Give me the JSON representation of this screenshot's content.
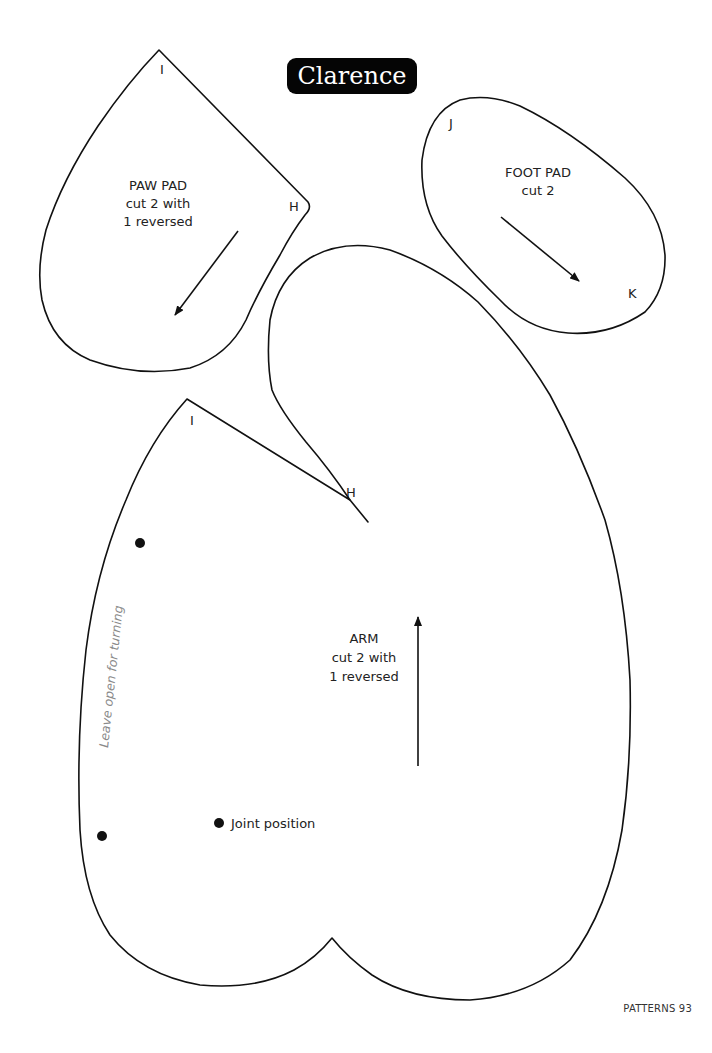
{
  "title": "Clarence",
  "page_footer": "PATTERNS 93",
  "pieces": {
    "paw_pad": {
      "name": "PAW PAD",
      "instruction_line1": "cut 2 with",
      "instruction_line2": "1 reversed",
      "marks": [
        "I",
        "H"
      ]
    },
    "foot_pad": {
      "name": "FOOT PAD",
      "instruction_line1": "cut 2",
      "marks": [
        "J",
        "K"
      ]
    },
    "arm": {
      "name": "ARM",
      "instruction_line1": "cut 2 with",
      "instruction_line2": "1 reversed",
      "marks": [
        "I",
        "H"
      ],
      "opening_note": "Leave open for turning",
      "joint_label": "Joint position"
    }
  },
  "colors": {
    "line": "#111111",
    "title_bg": "#050505",
    "title_fg": "#ffffff",
    "note_gray": "#8a8a8a"
  }
}
